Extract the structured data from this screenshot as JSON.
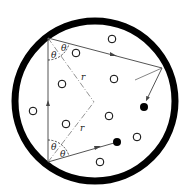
{
  "diagram": {
    "labels": {
      "theta": "θ",
      "radius": "r"
    },
    "counts": {
      "open_particles": 9,
      "filled_particles": 2
    },
    "colors": {
      "boundary": "#000000",
      "ray": "#555555",
      "bisector": "#777777",
      "particle_fill_open": "#ffffff",
      "particle_fill_solid": "#000000"
    }
  }
}
